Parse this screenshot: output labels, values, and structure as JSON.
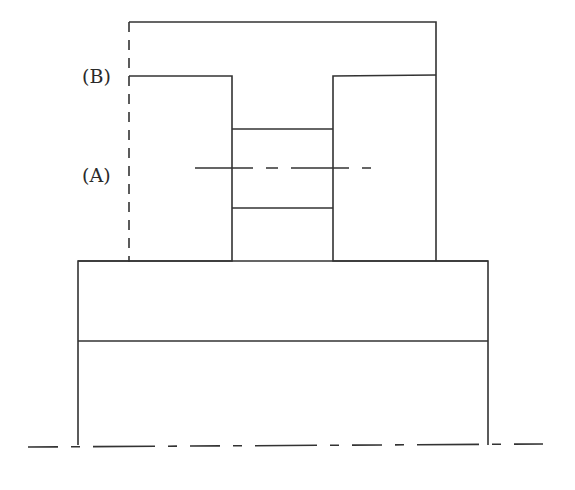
{
  "diagram": {
    "type": "mechanical-cross-section",
    "labels": [
      {
        "id": "B",
        "text": "(B)"
      },
      {
        "id": "A",
        "text": "(A)"
      }
    ],
    "components": [
      "outer-top-frame",
      "left-column",
      "right-column",
      "neck-gap",
      "base-plate",
      "base-lower-section",
      "dashed-outline-left",
      "center-axis-horizontal",
      "bottom-symmetry-axis"
    ],
    "colors": {
      "line": "#333333",
      "background": "#ffffff"
    }
  }
}
